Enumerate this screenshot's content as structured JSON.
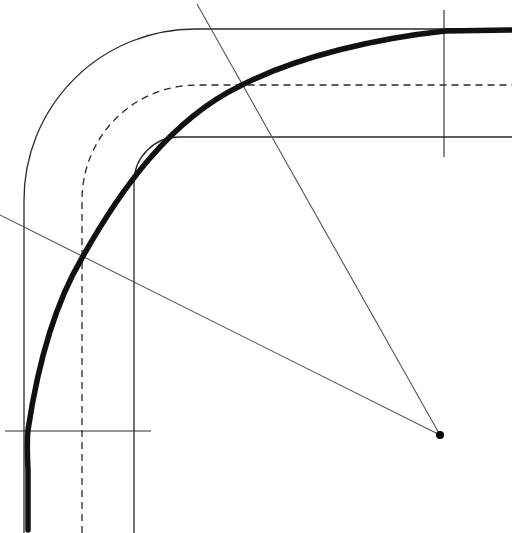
{
  "diagram": {
    "title": "",
    "colors": {
      "background": "#ffffff",
      "line": "#2a2a2a",
      "thick_curve": "#111111",
      "construction": "#555555",
      "center_point": "#000000"
    },
    "elements": {
      "outer_edge": "outer track boundary with rounded corner",
      "centerline": "dashed track centerline with rounded corner",
      "inner_edge": "inner track boundary with rounded corner",
      "transition_curve": "thick racing line / transition curve",
      "radial_lines": "two radius lines from center point",
      "center_point": "arc center",
      "tick_marks": "perpendicular tangent-point markers"
    }
  }
}
